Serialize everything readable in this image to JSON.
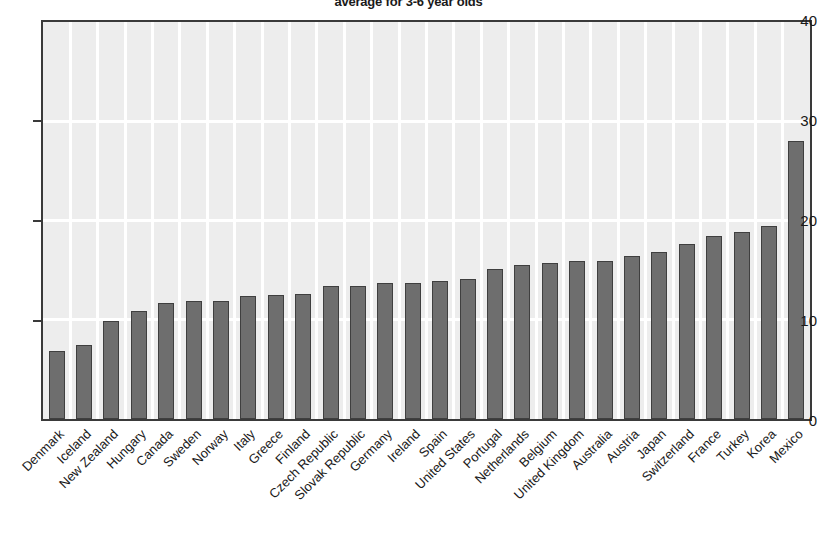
{
  "chart_data": {
    "type": "bar",
    "title": "average for 3-6 year olds",
    "xlabel": "",
    "ylabel": "",
    "ylim": [
      0,
      40
    ],
    "yticks": [
      0,
      10,
      20,
      30,
      40
    ],
    "grid": "white gridlines on light-grey panel",
    "legend": "none",
    "bar_color": "#6e6e6e",
    "bar_edge_color": "#3f3f3f",
    "panel_color": "#ededed",
    "gridline_color": "#ffffff",
    "axis_color": "#3a3a3a",
    "categories": [
      "Denmark",
      "Iceland",
      "New Zealand",
      "Hungary",
      "Canada",
      "Sweden",
      "Norway",
      "Italy",
      "Greece",
      "Finland",
      "Czech Republic",
      "Slovak Republic",
      "Germany",
      "Ireland",
      "Spain",
      "United States",
      "Portugal",
      "Netherlands",
      "Belgium",
      "United Kingdom",
      "Australia",
      "Austria",
      "Japan",
      "Switzerland",
      "France",
      "Turkey",
      "Korea",
      "Mexico"
    ],
    "values": [
      6.9,
      7.5,
      9.9,
      10.9,
      11.7,
      11.9,
      11.9,
      12.4,
      12.5,
      12.6,
      13.4,
      13.4,
      13.7,
      13.7,
      13.9,
      14.1,
      15.1,
      15.5,
      15.7,
      15.9,
      15.9,
      16.4,
      16.8,
      17.6,
      18.4,
      18.8,
      19.4,
      28.0
    ]
  },
  "axis": {
    "y_tick_labels": [
      "0",
      "10",
      "20",
      "30",
      "40"
    ]
  }
}
